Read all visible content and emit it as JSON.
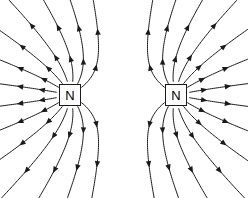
{
  "figure": {
    "width": 248,
    "height": 198,
    "background_color": "#ffffff",
    "line_color": "#1a1a1a",
    "line_width": 1.0
  },
  "poles": [
    {
      "id": "left-pole",
      "label": "N",
      "polarity": "north",
      "cx": 70,
      "cy": 95,
      "box_width": 22,
      "box_height": 22,
      "border_color": "#1a1a1a",
      "fill_color": "#ffffff",
      "text_color": "#000000"
    },
    {
      "id": "right-pole",
      "label": "N",
      "polarity": "north",
      "cx": 176,
      "cy": 95,
      "box_width": 22,
      "box_height": 22,
      "border_color": "#1a1a1a",
      "fill_color": "#ffffff",
      "text_color": "#000000"
    }
  ],
  "field": {
    "lines_per_pole": 16,
    "arrow_direction": "outward",
    "arrowheads_per_line": 2,
    "neutral_point": {
      "x": 123,
      "y": 95
    },
    "description": "Field lines radiate outward from each north pole and curve away from the midline, showing mutual repulsion with a neutral point at the centre."
  }
}
